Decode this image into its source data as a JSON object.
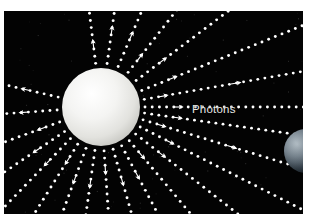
{
  "figure": {
    "domain": "Diagram",
    "caption_label": "Photons",
    "background_color": "#ffffff",
    "plate_color": "#030303",
    "plate": {
      "x": 4,
      "y": 11,
      "width": 299,
      "height": 203
    }
  },
  "sun": {
    "name": "Sun",
    "color": "#f2f2f0",
    "highlight_color": "#ffffff",
    "shadow_color": "#b9b9b6",
    "center_x": 97,
    "center_y": 96,
    "radius": 39
  },
  "earth": {
    "name": "Earth",
    "color": "#6f7d88",
    "dark_color": "#0b1014",
    "center_x": 302,
    "center_y": 140,
    "radius": 22
  },
  "photons": {
    "label": "Photons",
    "label_x": 188,
    "label_y": 92,
    "dot_color": "#ffffff",
    "dot_radius": 1.45,
    "dot_spacing": 7.2,
    "arrow_color": "#ffffff",
    "ray_count": 24,
    "ray_angles_deg": [
      -97,
      -82,
      -67,
      -52,
      -37,
      -22,
      -10,
      0,
      8,
      17,
      27,
      38,
      50,
      62,
      74,
      86,
      98,
      110,
      122,
      134,
      146,
      160,
      176,
      193
    ]
  },
  "chart_data": {
    "type": "scatter",
    "annotations": [
      "Photons"
    ],
    "series": [
      {
        "name": "Sun",
        "values": [
          1
        ]
      },
      {
        "name": "Photon rays",
        "values": [
          24
        ]
      },
      {
        "name": "Earth",
        "values": [
          1
        ]
      }
    ]
  }
}
